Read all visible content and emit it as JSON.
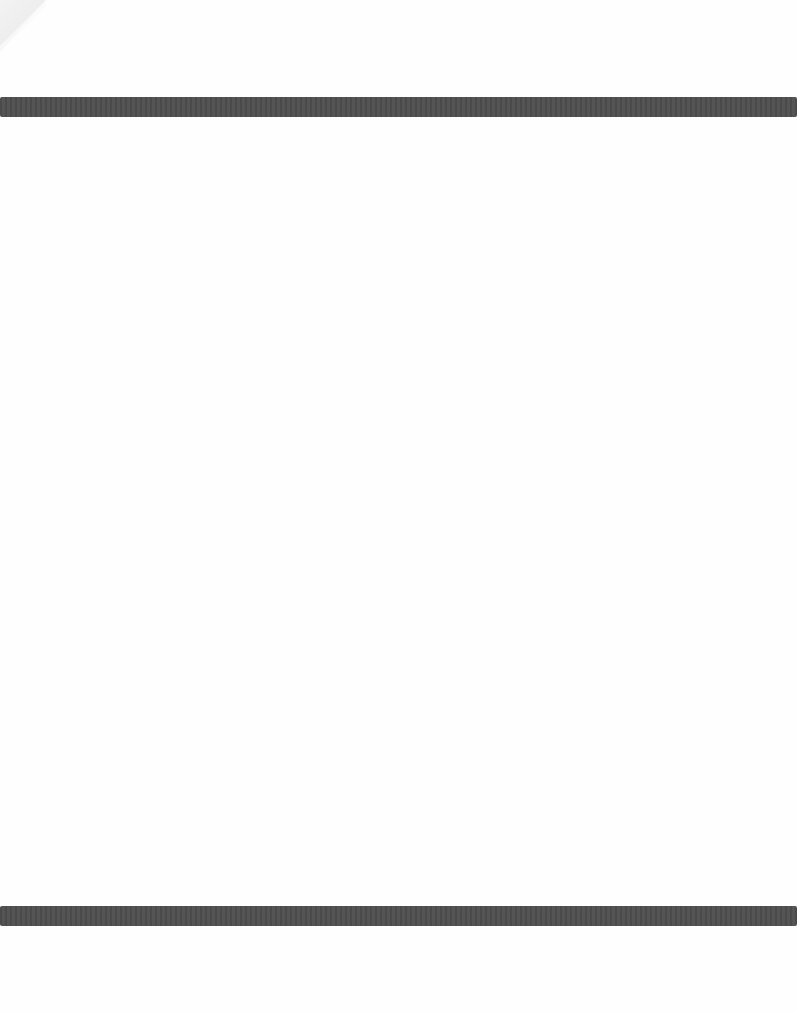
{
  "document": {
    "type": "scanned-page",
    "header_text": "",
    "body_text": "",
    "footer_text": "",
    "colors": {
      "page_background": "#fefefe",
      "bar_color": "#4f4f4f",
      "corner_fold": "#ececec"
    },
    "decorations": {
      "top_bar": {
        "label": "top-rule"
      },
      "bottom_bar": {
        "label": "bottom-rule"
      },
      "corner": {
        "label": "folded-corner"
      }
    }
  }
}
